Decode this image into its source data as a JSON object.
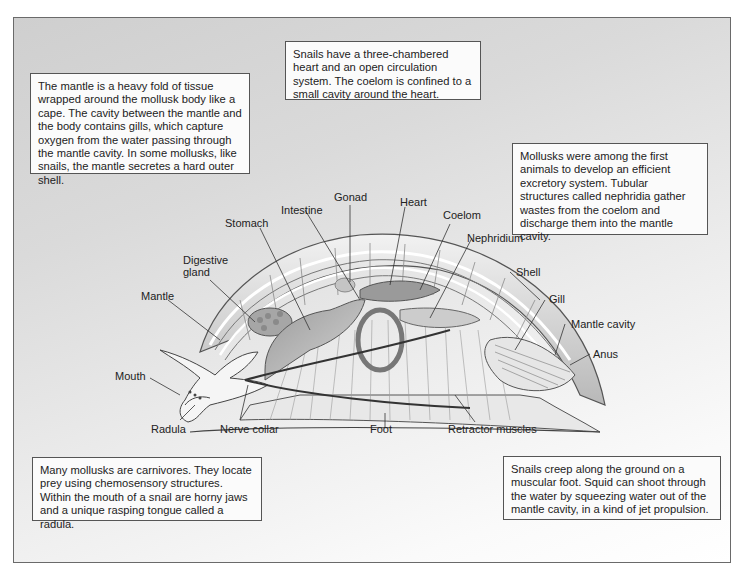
{
  "diagram": {
    "callouts": {
      "mantle": "The mantle is a heavy fold of tissue wrapped around the mollusk body like a cape. The cavity between the mantle and the body contains gills, which capture oxygen from the water passing through the mantle cavity. In some mollusks, like snails, the mantle secretes a hard outer shell.",
      "heart": "Snails have a three-chambered heart and an open circulation system. The coelom is confined to a small cavity around the heart.",
      "excretion": "Mollusks were among the first animals to develop an efficient excretory system. Tubular structures called nephridia gather wastes from the coelom and discharge them into the mantle cavity.",
      "feeding": "Many mollusks are carnivores. They locate prey using chemosensory structures. Within the mouth of a snail are horny jaws and a unique rasping tongue called a radula.",
      "locomotion": "Snails creep along the ground on a muscular foot. Squid can shoot through the water by squeezing water out of the mantle cavity, in a kind of jet propulsion."
    },
    "labels": {
      "gonad": "Gonad",
      "heart": "Heart",
      "intestine": "Intestine",
      "coelom": "Coelom",
      "stomach": "Stomach",
      "nephridium": "Nephridium",
      "digestive_gland_1": "Digestive",
      "digestive_gland_2": "gland",
      "shell": "Shell",
      "mantle": "Mantle",
      "gill": "Gill",
      "mantle_cavity": "Mantle cavity",
      "anus": "Anus",
      "mouth": "Mouth",
      "radula": "Radula",
      "nerve_collar": "Nerve collar",
      "foot": "Foot",
      "retractor_muscles": "Retractor muscles"
    },
    "colors": {
      "frame_border": "#6a6a6a",
      "frame_bg_start": "#cfcfcf",
      "frame_bg_end": "#ffffff",
      "box_bg": "#fbfbfb",
      "ink": "#222222"
    }
  }
}
